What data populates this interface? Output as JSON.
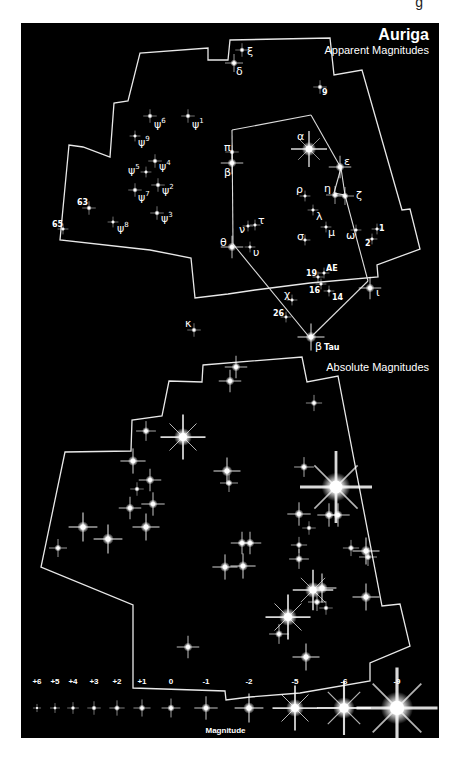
{
  "header": {
    "title": "Auriga",
    "subtitle_apparent": "Apparent Magnitudes",
    "subtitle_absolute": "Absolute Magnitudes",
    "top_cutoff_glyph": "g"
  },
  "colors": {
    "background": "#000000",
    "foreground": "#ffffff",
    "page": "#ffffff"
  },
  "apparent_chart": {
    "boundary": [
      [
        230,
        40
      ],
      [
        330,
        38
      ],
      [
        334,
        75
      ],
      [
        362,
        70
      ],
      [
        402,
        210
      ],
      [
        410,
        209
      ],
      [
        420,
        249
      ],
      [
        377,
        265
      ],
      [
        378,
        277
      ],
      [
        310,
        283
      ],
      [
        255,
        290
      ],
      [
        228,
        294
      ],
      [
        195,
        298
      ],
      [
        191,
        258
      ],
      [
        150,
        250
      ],
      [
        60,
        240
      ],
      [
        69,
        145
      ],
      [
        83,
        147
      ],
      [
        110,
        157
      ],
      [
        114,
        103
      ],
      [
        128,
        101
      ],
      [
        140,
        53
      ],
      [
        208,
        48
      ],
      [
        208,
        60
      ],
      [
        228,
        60
      ]
    ],
    "lines": [
      [
        [
          232,
          130
        ],
        [
          311,
          115
        ]
      ],
      [
        [
          311,
          115
        ],
        [
          341,
          168
        ]
      ],
      [
        [
          232,
          130
        ],
        [
          233,
          244
        ]
      ],
      [
        [
          233,
          244
        ],
        [
          310,
          338
        ]
      ],
      [
        [
          310,
          338
        ],
        [
          368,
          281
        ]
      ],
      [
        [
          341,
          168
        ],
        [
          334,
          193
        ]
      ],
      [
        [
          341,
          168
        ],
        [
          345,
          195
        ]
      ],
      [
        [
          345,
          195
        ],
        [
          368,
          281
        ]
      ],
      [
        [
          334,
          193
        ],
        [
          345,
          195
        ]
      ]
    ],
    "stars": [
      {
        "label": "ξ",
        "x": 242,
        "y": 50,
        "r": 1.5,
        "lx": 247,
        "ly": 55
      },
      {
        "label": "δ",
        "x": 234,
        "y": 63,
        "r": 2,
        "lx": 236,
        "ly": 75
      },
      {
        "label": "9",
        "x": 320,
        "y": 87,
        "r": 1.5,
        "lx": 322,
        "ly": 95
      },
      {
        "label": "ψ6",
        "x": 150,
        "y": 116,
        "r": 1.5,
        "lx": 154,
        "ly": 128
      },
      {
        "label": "ψ1",
        "x": 188,
        "y": 116,
        "r": 1.5,
        "lx": 192,
        "ly": 128
      },
      {
        "label": "ψ9",
        "x": 135,
        "y": 136,
        "r": 1.2,
        "lx": 138,
        "ly": 146
      },
      {
        "label": "ψ5",
        "x": 146,
        "y": 172,
        "r": 1.2,
        "lx": 128,
        "ly": 174
      },
      {
        "label": "ψ4",
        "x": 155,
        "y": 161,
        "r": 1.5,
        "lx": 159,
        "ly": 170
      },
      {
        "label": "ψ2",
        "x": 158,
        "y": 185,
        "r": 1.5,
        "lx": 162,
        "ly": 194
      },
      {
        "label": "ψ7",
        "x": 135,
        "y": 190,
        "r": 1.5,
        "lx": 138,
        "ly": 201
      },
      {
        "label": "ψ3",
        "x": 157,
        "y": 213,
        "r": 1.5,
        "lx": 161,
        "ly": 222
      },
      {
        "label": "ψ8",
        "x": 113,
        "y": 222,
        "r": 1.2,
        "lx": 117,
        "ly": 232
      },
      {
        "label": "63",
        "x": 89,
        "y": 208,
        "r": 1.5,
        "lx": 77,
        "ly": 205
      },
      {
        "label": "65",
        "x": 63,
        "y": 229,
        "r": 1.2,
        "lx": 52,
        "ly": 227
      },
      {
        "label": "π",
        "x": 232,
        "y": 152,
        "r": 1.5,
        "lx": 224,
        "ly": 151
      },
      {
        "label": "β",
        "x": 232,
        "y": 163,
        "r": 2.5,
        "lx": 224,
        "ly": 176
      },
      {
        "label": "α",
        "x": 309,
        "y": 149,
        "r": 4,
        "lx": 297,
        "ly": 140
      },
      {
        "label": "ε",
        "x": 340,
        "y": 167,
        "r": 2.5,
        "lx": 344,
        "ly": 165
      },
      {
        "label": "η",
        "x": 335,
        "y": 195,
        "r": 2,
        "lx": 324,
        "ly": 192
      },
      {
        "label": "ζ",
        "x": 345,
        "y": 196,
        "r": 2,
        "lx": 356,
        "ly": 199
      },
      {
        "label": "ρ",
        "x": 305,
        "y": 196,
        "r": 1.2,
        "lx": 296,
        "ly": 193
      },
      {
        "label": "λ",
        "x": 313,
        "y": 210,
        "r": 1.2,
        "lx": 316,
        "ly": 220
      },
      {
        "label": "μ",
        "x": 326,
        "y": 227,
        "r": 1.2,
        "lx": 328,
        "ly": 236
      },
      {
        "label": "ω",
        "x": 356,
        "y": 230,
        "r": 1.2,
        "lx": 346,
        "ly": 239
      },
      {
        "label": "1",
        "x": 377,
        "y": 229,
        "r": 1.2,
        "lx": 379,
        "ly": 231
      },
      {
        "label": "2",
        "x": 372,
        "y": 239,
        "r": 1.2,
        "lx": 365,
        "ly": 246
      },
      {
        "label": "σ",
        "x": 305,
        "y": 240,
        "r": 1.2,
        "lx": 297,
        "ly": 240
      },
      {
        "label": "ν",
        "x": 248,
        "y": 226,
        "r": 1.2,
        "lx": 239,
        "ly": 233
      },
      {
        "label": "τ",
        "x": 255,
        "y": 225,
        "r": 1.2,
        "lx": 258,
        "ly": 224
      },
      {
        "label": "θ",
        "x": 232,
        "y": 247,
        "r": 2.5,
        "lx": 220,
        "ly": 246
      },
      {
        "label": "υ",
        "x": 250,
        "y": 247,
        "r": 1.2,
        "lx": 253,
        "ly": 256
      },
      {
        "label": "ι",
        "x": 370,
        "y": 288,
        "r": 2.5,
        "lx": 376,
        "ly": 296
      },
      {
        "label": "AE",
        "x": 324,
        "y": 273,
        "r": 1.2,
        "lx": 326,
        "ly": 271
      },
      {
        "label": "19",
        "x": 318,
        "y": 277,
        "r": 1.2,
        "lx": 306,
        "ly": 276
      },
      {
        "label": "16",
        "x": 321,
        "y": 284,
        "r": 1.2,
        "lx": 309,
        "ly": 293
      },
      {
        "label": "14",
        "x": 329,
        "y": 291,
        "r": 1.2,
        "lx": 332,
        "ly": 300
      },
      {
        "label": "χ",
        "x": 292,
        "y": 300,
        "r": 1.2,
        "lx": 284,
        "ly": 298
      },
      {
        "label": "26",
        "x": 286,
        "y": 317,
        "r": 1.2,
        "lx": 273,
        "ly": 316
      },
      {
        "label": "κ",
        "x": 194,
        "y": 330,
        "r": 1.5,
        "lx": 185,
        "ly": 327
      },
      {
        "label": "β Tau",
        "x": 311,
        "y": 337,
        "r": 3,
        "lx": 315,
        "ly": 350
      }
    ]
  },
  "absolute_chart": {
    "boundary": [
      [
        203,
        365
      ],
      [
        302,
        357
      ],
      [
        307,
        382
      ],
      [
        338,
        376
      ],
      [
        382,
        606
      ],
      [
        400,
        604
      ],
      [
        410,
        646
      ],
      [
        370,
        663
      ],
      [
        370,
        681
      ],
      [
        300,
        693
      ],
      [
        250,
        697
      ],
      [
        226,
        700
      ],
      [
        225,
        691
      ],
      [
        133,
        688
      ],
      [
        133,
        605
      ],
      [
        41,
        567
      ],
      [
        65,
        452
      ],
      [
        131,
        451
      ],
      [
        132,
        420
      ],
      [
        162,
        416
      ],
      [
        169,
        381
      ],
      [
        202,
        382
      ]
    ],
    "stars": [
      {
        "x": 236,
        "y": 367,
        "r": 2.5
      },
      {
        "x": 230,
        "y": 381,
        "r": 2.5
      },
      {
        "x": 314,
        "y": 403,
        "r": 1.8
      },
      {
        "x": 183,
        "y": 437,
        "r": 5
      },
      {
        "x": 146,
        "y": 431,
        "r": 2.2
      },
      {
        "x": 133,
        "y": 461,
        "r": 2.8
      },
      {
        "x": 150,
        "y": 480,
        "r": 2.5
      },
      {
        "x": 137,
        "y": 489,
        "r": 1.5
      },
      {
        "x": 153,
        "y": 504,
        "r": 2.6
      },
      {
        "x": 130,
        "y": 508,
        "r": 2.5
      },
      {
        "x": 146,
        "y": 527,
        "r": 3
      },
      {
        "x": 83,
        "y": 527,
        "r": 3.2
      },
      {
        "x": 108,
        "y": 539,
        "r": 3.2
      },
      {
        "x": 58,
        "y": 548,
        "r": 2
      },
      {
        "x": 227,
        "y": 471,
        "r": 3
      },
      {
        "x": 229,
        "y": 483,
        "r": 2
      },
      {
        "x": 304,
        "y": 467,
        "r": 2.2
      },
      {
        "x": 336,
        "y": 487,
        "r": 8
      },
      {
        "x": 299,
        "y": 514,
        "r": 2.6
      },
      {
        "x": 329,
        "y": 515,
        "r": 2.6
      },
      {
        "x": 338,
        "y": 515,
        "r": 2.6
      },
      {
        "x": 309,
        "y": 528,
        "r": 1.5
      },
      {
        "x": 242,
        "y": 543,
        "r": 2.5
      },
      {
        "x": 250,
        "y": 543,
        "r": 2.5
      },
      {
        "x": 225,
        "y": 567,
        "r": 2.8
      },
      {
        "x": 243,
        "y": 566,
        "r": 2.8
      },
      {
        "x": 299,
        "y": 545,
        "r": 1.8
      },
      {
        "x": 299,
        "y": 559,
        "r": 2.2
      },
      {
        "x": 351,
        "y": 548,
        "r": 1.8
      },
      {
        "x": 366,
        "y": 551,
        "r": 3
      },
      {
        "x": 368,
        "y": 557,
        "r": 2
      },
      {
        "x": 313,
        "y": 590,
        "r": 4.5
      },
      {
        "x": 322,
        "y": 588,
        "r": 3.2
      },
      {
        "x": 317,
        "y": 602,
        "r": 2
      },
      {
        "x": 326,
        "y": 608,
        "r": 1.5
      },
      {
        "x": 288,
        "y": 617,
        "r": 5
      },
      {
        "x": 279,
        "y": 634,
        "r": 2.2
      },
      {
        "x": 366,
        "y": 597,
        "r": 3
      },
      {
        "x": 188,
        "y": 647,
        "r": 2.5
      },
      {
        "x": 306,
        "y": 657,
        "r": 3
      }
    ]
  },
  "legend": {
    "label": "Magnitude",
    "items": [
      {
        "label": "+6",
        "x": 37,
        "r": 0.9
      },
      {
        "label": "+5",
        "x": 55,
        "r": 1.1
      },
      {
        "label": "+4",
        "x": 73,
        "r": 1.3
      },
      {
        "label": "+3",
        "x": 94,
        "r": 1.5
      },
      {
        "label": "+2",
        "x": 117,
        "r": 1.7
      },
      {
        "label": "+1",
        "x": 142,
        "r": 1.9
      },
      {
        "label": "0",
        "x": 171,
        "r": 2.1
      },
      {
        "label": "-1",
        "x": 206,
        "r": 2.6
      },
      {
        "label": "-2",
        "x": 249,
        "r": 3.2
      },
      {
        "label": "-5",
        "x": 295,
        "r": 5
      },
      {
        "label": "-6",
        "x": 344,
        "r": 6
      },
      {
        "label": "-9",
        "x": 397,
        "r": 9
      }
    ],
    "label_y": 684,
    "star_y": 708
  }
}
